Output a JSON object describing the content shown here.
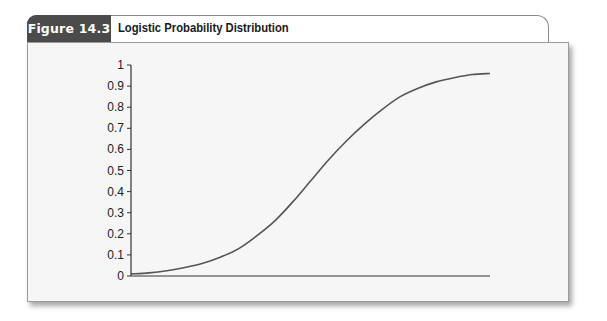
{
  "figure": {
    "number_label": "Figure 14.3",
    "title": "Logistic Probability Distribution"
  },
  "colors": {
    "tab_bg": "#4b4b4b",
    "panel_bg": "#f6f6f6",
    "curve": "#555555",
    "axis": "#333333"
  },
  "chart_data": {
    "type": "line",
    "title": "Logistic Probability Distribution",
    "xlabel": "",
    "ylabel": "",
    "ylim": [
      0,
      1
    ],
    "y_ticks": [
      "0",
      "0.1",
      "0.2",
      "0.3",
      "0.4",
      "0.5",
      "0.6",
      "0.7",
      "0.8",
      "0.9",
      "1"
    ],
    "x_ticks": [],
    "grid": false,
    "legend": null,
    "series": [
      {
        "name": "Logistic CDF",
        "x": [
          0,
          0.05,
          0.1,
          0.15,
          0.2,
          0.25,
          0.3,
          0.35,
          0.4,
          0.45,
          0.5,
          0.55,
          0.6,
          0.65,
          0.7,
          0.75,
          0.8,
          0.85,
          0.9,
          0.95,
          1.0
        ],
        "values": [
          0.01,
          0.015,
          0.025,
          0.04,
          0.06,
          0.09,
          0.13,
          0.19,
          0.26,
          0.35,
          0.45,
          0.55,
          0.64,
          0.72,
          0.79,
          0.85,
          0.89,
          0.92,
          0.94,
          0.955,
          0.96
        ]
      }
    ]
  }
}
